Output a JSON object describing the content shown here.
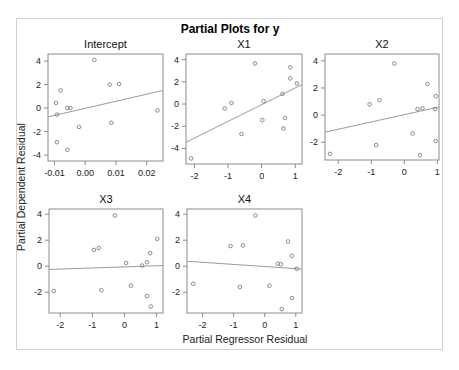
{
  "chart_data": {
    "type": "scatter",
    "title": "Partial Plots for y",
    "xlabel": "Partial Regressor Residual",
    "ylabel": "Partial Dependent Residual",
    "grid": false,
    "legend": null,
    "panels": [
      {
        "name": "Intercept",
        "xticks": [
          -0.01,
          0.0,
          0.01,
          0.02
        ],
        "xtick_labels": [
          "-0.01",
          "0.00",
          "0.01",
          "0.02"
        ],
        "yticks": [
          4,
          2,
          0,
          -2,
          -4
        ],
        "xlim": [
          -0.0121,
          0.0253
        ],
        "ylim": [
          -4.5,
          4.6
        ],
        "points": [
          [
            0.003,
            4.1
          ],
          [
            0.008,
            2.0
          ],
          [
            0.011,
            2.05
          ],
          [
            -0.008,
            1.5
          ],
          [
            -0.0095,
            0.45
          ],
          [
            -0.0058,
            0.0
          ],
          [
            -0.0048,
            0.0
          ],
          [
            -0.0092,
            -0.55
          ],
          [
            0.0235,
            -0.2
          ],
          [
            0.0085,
            -1.25
          ],
          [
            -0.002,
            -1.6
          ],
          [
            -0.0092,
            -2.9
          ],
          [
            -0.0058,
            -3.55
          ]
        ],
        "fit_line": [
          [
            -0.0121,
            -0.75
          ],
          [
            0.0253,
            1.5
          ]
        ]
      },
      {
        "name": "X1",
        "xticks": [
          -2,
          -1,
          0,
          1
        ],
        "xtick_labels": [
          "-2",
          "-1",
          "0",
          "1"
        ],
        "yticks": [
          4,
          2,
          0,
          -2,
          -4
        ],
        "xlim": [
          -2.25,
          1.2
        ],
        "ylim": [
          -5.4,
          4.5
        ],
        "points": [
          [
            -0.2,
            3.65
          ],
          [
            0.85,
            3.3
          ],
          [
            0.85,
            2.3
          ],
          [
            1.05,
            1.85
          ],
          [
            0.62,
            0.9
          ],
          [
            0.06,
            0.25
          ],
          [
            -0.9,
            0.1
          ],
          [
            -1.1,
            -0.4
          ],
          [
            0.02,
            -1.45
          ],
          [
            0.7,
            -1.25
          ],
          [
            0.65,
            -2.2
          ],
          [
            -0.6,
            -2.7
          ],
          [
            -2.1,
            -4.9
          ]
        ],
        "fit_line": [
          [
            -2.25,
            -3.45
          ],
          [
            1.2,
            1.75
          ]
        ]
      },
      {
        "name": "X2",
        "xticks": [
          -2,
          -1,
          0,
          1
        ],
        "xtick_labels": [
          "-2",
          "-1",
          "0",
          "1"
        ],
        "yticks": [
          4,
          2,
          0,
          -2
        ],
        "xlim": [
          -2.4,
          1.05
        ],
        "ylim": [
          -3.3,
          4.5
        ],
        "points": [
          [
            -0.3,
            3.8
          ],
          [
            0.7,
            2.3
          ],
          [
            0.95,
            1.4
          ],
          [
            -1.05,
            0.8
          ],
          [
            -0.75,
            1.1
          ],
          [
            0.4,
            0.45
          ],
          [
            0.55,
            0.5
          ],
          [
            0.93,
            0.45
          ],
          [
            0.25,
            -1.35
          ],
          [
            0.95,
            -1.9
          ],
          [
            -0.85,
            -2.2
          ],
          [
            0.47,
            -2.95
          ],
          [
            -2.25,
            -2.85
          ]
        ],
        "fit_line": [
          [
            -2.4,
            -1.25
          ],
          [
            1.05,
            0.6
          ]
        ]
      },
      {
        "name": "X3",
        "xticks": [
          -2,
          -1,
          0,
          1
        ],
        "xtick_labels": [
          "-2",
          "-1",
          "0",
          "1"
        ],
        "yticks": [
          4,
          2,
          0,
          -2
        ],
        "xlim": [
          -2.35,
          1.2
        ],
        "ylim": [
          -3.6,
          4.4
        ],
        "points": [
          [
            -0.3,
            3.9
          ],
          [
            1.02,
            2.1
          ],
          [
            -0.95,
            1.25
          ],
          [
            -0.8,
            1.4
          ],
          [
            0.8,
            1.0
          ],
          [
            0.7,
            0.3
          ],
          [
            0.55,
            0.05
          ],
          [
            0.05,
            0.25
          ],
          [
            0.2,
            -1.5
          ],
          [
            -0.72,
            -1.85
          ],
          [
            -2.2,
            -1.9
          ],
          [
            0.7,
            -2.3
          ],
          [
            0.82,
            -3.1
          ]
        ],
        "fit_line": [
          [
            -2.35,
            -0.25
          ],
          [
            1.2,
            0.05
          ]
        ]
      },
      {
        "name": "X4",
        "xticks": [
          -2,
          -1,
          0,
          1
        ],
        "xtick_labels": [
          "-2",
          "-1",
          "0",
          "1"
        ],
        "yticks": [
          4,
          2,
          0,
          -2
        ],
        "xlim": [
          -2.5,
          1.2
        ],
        "ylim": [
          -3.6,
          4.4
        ],
        "points": [
          [
            -0.3,
            3.9
          ],
          [
            0.75,
            1.9
          ],
          [
            -1.1,
            1.55
          ],
          [
            -0.7,
            1.6
          ],
          [
            0.87,
            0.8
          ],
          [
            0.42,
            0.2
          ],
          [
            0.52,
            0.15
          ],
          [
            1.03,
            -0.2
          ],
          [
            -2.3,
            -1.35
          ],
          [
            -0.8,
            -1.6
          ],
          [
            0.15,
            -1.5
          ],
          [
            0.88,
            -2.45
          ],
          [
            0.55,
            -3.3
          ]
        ],
        "fit_line": [
          [
            -2.5,
            0.38
          ],
          [
            1.2,
            -0.22
          ]
        ]
      }
    ]
  },
  "colors": {
    "marker": "#707070",
    "fit_line": "#9a9a9a",
    "panel_border": "#8c8c8c",
    "frame_border": "#d0d0d0",
    "text": "#222222"
  }
}
